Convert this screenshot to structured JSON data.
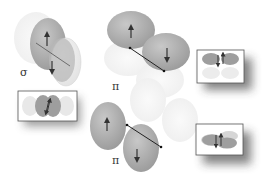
{
  "diagram": {
    "type": "molecular-orbital-overlap",
    "labels": {
      "sigma": "σ",
      "pi_top": "π",
      "pi_bottom": "π"
    },
    "panels": [
      {
        "id": "sigma",
        "label": "σ",
        "description": "end-on p orbital overlap, spin up and spin down arrows"
      },
      {
        "id": "pi-top",
        "label": "π",
        "description": "side-on p orbital overlap, spin up and spin down arrows"
      },
      {
        "id": "pi-bottom",
        "label": "π",
        "description": "side-on p orbital overlap, spin up and spin down arrows"
      }
    ],
    "insets": [
      {
        "id": "inset-sigma",
        "description": "top-down view of sigma bond with paired spins"
      },
      {
        "id": "inset-pi-top",
        "description": "top-down view of pi bond with paired spins"
      },
      {
        "id": "inset-pi-bottom",
        "description": "top-down view of pi bond with paired spins"
      }
    ],
    "colors": {
      "lobe_dark": "#a9a9a9",
      "lobe_light": "#ececec",
      "arrow": "#333333",
      "inset_border": "#555555",
      "shadow": "#6a6a6a"
    }
  }
}
